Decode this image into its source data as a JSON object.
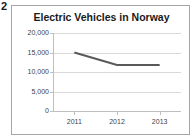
{
  "figure": {
    "number": "2"
  },
  "chart_data": {
    "type": "line",
    "title": "Electric Vehicles in Norway",
    "xlabel": "",
    "ylabel": "",
    "categories": [
      "2011",
      "2012",
      "2013"
    ],
    "values": [
      15000,
      11800,
      11800
    ],
    "series": [
      {
        "name": "Electric Vehicles",
        "values": [
          15000,
          11800,
          11800
        ],
        "color": "#595959"
      }
    ],
    "ylim": [
      0,
      20000
    ],
    "ytick_values": [
      0,
      5000,
      10000,
      15000,
      20000
    ],
    "ytick_labels": [
      "0",
      "5,000",
      "10,000",
      "15,000",
      "20,000"
    ],
    "xtick_labels": [
      "2011",
      "2012",
      "2013"
    ],
    "grid": true,
    "grid_axis": "y",
    "grid_color": "#d9d9d9",
    "legend": false,
    "legend_position": "none",
    "markers": false,
    "plot_background": "#ffffff",
    "frame_border_color": "#a6a6a6",
    "axis_color": "#bfbfbf",
    "text_color": "#3f3f3f"
  }
}
